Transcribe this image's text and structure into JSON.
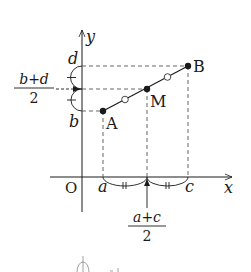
{
  "diagram": {
    "type": "coordinate-midpoint",
    "axes": {
      "x_label": "x",
      "y_label": "y",
      "origin_label": "O"
    },
    "points": [
      {
        "name": "A",
        "label": "A",
        "x_label": "a",
        "y_label": "b"
      },
      {
        "name": "M",
        "label": "M",
        "x_label": "a+c/2",
        "y_label": "b+d/2"
      },
      {
        "name": "B",
        "label": "B",
        "x_label": "c",
        "y_label": "d"
      }
    ],
    "x_ticks": {
      "a": "a",
      "c": "c",
      "mid_numerator": "a+c",
      "mid_denominator": "2"
    },
    "y_ticks": {
      "b": "b",
      "d": "d",
      "mid_numerator": "b+d",
      "mid_denominator": "2"
    },
    "colors": {
      "ink": "#1a1a1a",
      "dash": "#555555",
      "background": "#ffffff"
    }
  }
}
